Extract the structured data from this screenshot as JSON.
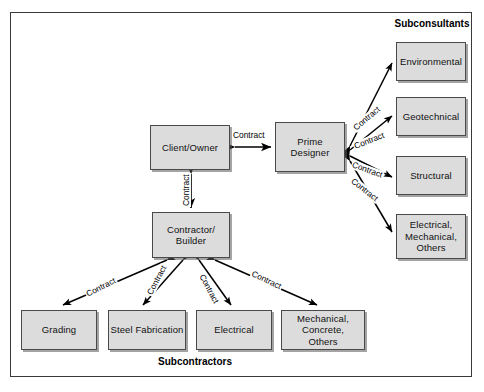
{
  "diagram": {
    "title_subconsultants": "Subconsultants",
    "title_subcontractors": "Subcontractors",
    "relationship_label": "Contract",
    "colors": {
      "node_fill": "#dcdcdc",
      "node_border": "#4a4a4a",
      "frame_border": "#3a3a3a",
      "arrow": "#000000",
      "text": "#111111"
    },
    "nodes": {
      "client": "Client/Owner",
      "prime_designer_line1": "Prime",
      "prime_designer_line2": "Designer",
      "contractor_line1": "Contractor/",
      "contractor_line2": "Builder"
    },
    "subconsultants": [
      {
        "id": "environmental",
        "label": "Environmental"
      },
      {
        "id": "geotechnical",
        "label": "Geotechnical"
      },
      {
        "id": "structural",
        "label": "Structural"
      },
      {
        "id": "electrical-mechanical-others",
        "line1": "Electrical,",
        "line2": "Mechanical,",
        "line3": "Others"
      }
    ],
    "subcontractors": [
      {
        "id": "grading",
        "label": "Grading"
      },
      {
        "id": "steel-fabrication",
        "label": "Steel Fabrication"
      },
      {
        "id": "electrical",
        "label": "Electrical"
      },
      {
        "id": "mechanical-concrete-others",
        "line1": "Mechanical,",
        "line2": "Concrete,",
        "line3": "Others"
      }
    ],
    "edges": [
      {
        "id": "client-prime",
        "label": "Contract"
      },
      {
        "id": "client-contractor",
        "label": "Contract"
      },
      {
        "id": "prime-environmental",
        "label": "Contract"
      },
      {
        "id": "prime-geotechnical",
        "label": "Contract"
      },
      {
        "id": "prime-structural",
        "label": "Contract"
      },
      {
        "id": "prime-electrical-mechanical",
        "label": "Contract"
      },
      {
        "id": "contractor-grading",
        "label": "Contract"
      },
      {
        "id": "contractor-steel",
        "label": "Contract"
      },
      {
        "id": "contractor-electrical",
        "label": "Contract"
      },
      {
        "id": "contractor-mechanical",
        "label": "Contract"
      }
    ]
  }
}
